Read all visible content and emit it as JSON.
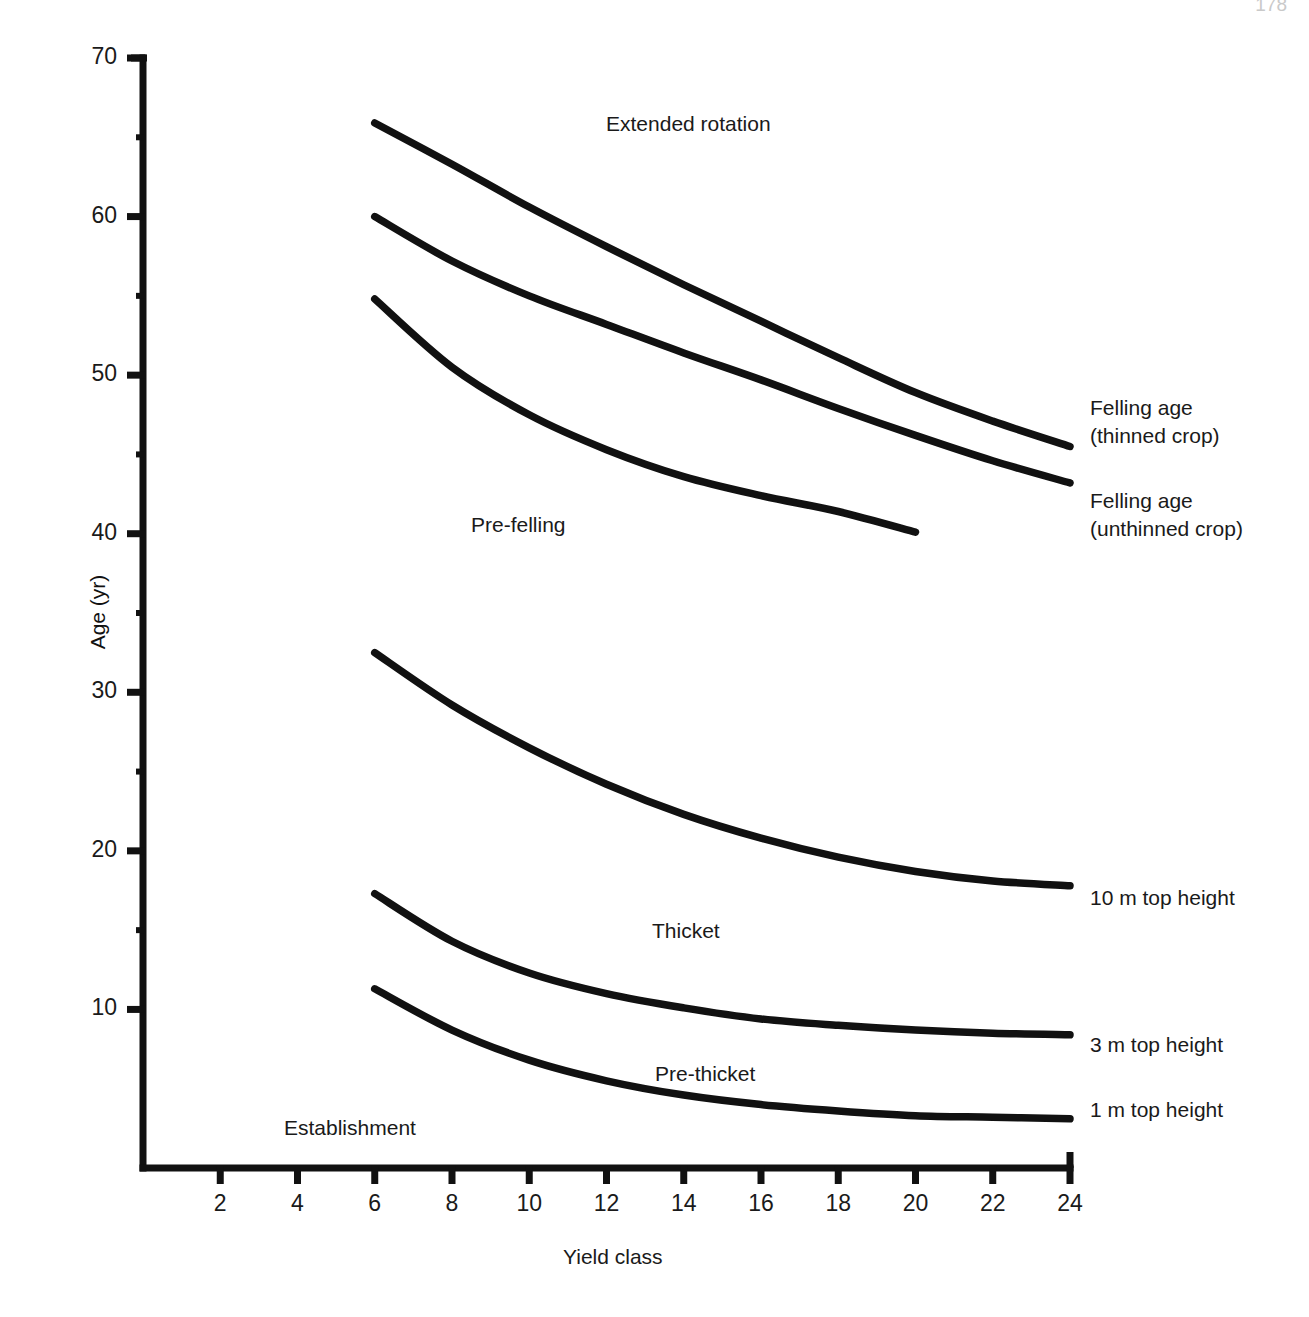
{
  "page": {
    "corner_mark": "178",
    "background": "#ffffff",
    "ink": "#111111"
  },
  "chart_data": {
    "type": "line",
    "title": "",
    "xlabel": "Yield class",
    "ylabel": "Age (yr)",
    "xlim": [
      0,
      25
    ],
    "ylim": [
      0,
      70
    ],
    "xticks": [
      2,
      4,
      6,
      8,
      10,
      12,
      14,
      16,
      18,
      20,
      22,
      24
    ],
    "yticks": [
      10,
      20,
      30,
      40,
      50,
      60,
      70
    ],
    "yminor": [
      15,
      25,
      35,
      45,
      55,
      65
    ],
    "grid": false,
    "legend_position": "right-of-plot (inline end-of-line labels)",
    "series": [
      {
        "name": "Extended rotation boundary",
        "end_label": "",
        "x": [
          6,
          8,
          10,
          12,
          14,
          16,
          18,
          20,
          22,
          24
        ],
        "y": [
          65.9,
          63.3,
          60.6,
          58.1,
          55.7,
          53.4,
          51.1,
          48.9,
          47.1,
          45.5
        ]
      },
      {
        "name": "Felling age (thinned crop)",
        "end_label": "Felling age\n(thinned crop)",
        "x": [
          6,
          8,
          10,
          12,
          14,
          16,
          18,
          20,
          22,
          24
        ],
        "y": [
          60.0,
          57.2,
          55.0,
          53.2,
          51.4,
          49.7,
          47.9,
          46.2,
          44.6,
          43.2
        ]
      },
      {
        "name": "Felling age (unthinned crop)",
        "end_label": "Felling age\n(unthinned crop)",
        "x": [
          6,
          8,
          10,
          12,
          14,
          16,
          18,
          20
        ],
        "y": [
          54.8,
          50.5,
          47.5,
          45.3,
          43.6,
          42.4,
          41.4,
          40.1
        ]
      },
      {
        "name": "10 m top height",
        "end_label": "10 m top height",
        "x": [
          6,
          8,
          10,
          12,
          14,
          16,
          18,
          20,
          22,
          24
        ],
        "y": [
          32.5,
          29.2,
          26.5,
          24.2,
          22.3,
          20.8,
          19.6,
          18.7,
          18.1,
          17.8
        ]
      },
      {
        "name": "3 m top height",
        "end_label": "3 m top height",
        "x": [
          6,
          8,
          10,
          12,
          14,
          16,
          18,
          20,
          22,
          24
        ],
        "y": [
          17.3,
          14.3,
          12.3,
          11.0,
          10.1,
          9.4,
          9.0,
          8.7,
          8.5,
          8.4
        ]
      },
      {
        "name": "1 m top height",
        "end_label": "1 m top height",
        "x": [
          6,
          8,
          10,
          12,
          14,
          16,
          18,
          20,
          22,
          24
        ],
        "y": [
          11.3,
          8.7,
          6.8,
          5.5,
          4.6,
          4.0,
          3.6,
          3.3,
          3.2,
          3.1
        ]
      }
    ],
    "zone_annotations": [
      {
        "text": "Extended rotation",
        "x": 20.5,
        "y": 68.3
      },
      {
        "text": "Pre-felling",
        "x": 12.6,
        "y": 42.7
      },
      {
        "text": "Thicket",
        "x": 18.0,
        "y": 16.2
      },
      {
        "text": "Pre-thicket",
        "x": 19.4,
        "y": 7.2
      },
      {
        "text": "Establishment",
        "x": 6.9,
        "y": 3.7
      }
    ]
  },
  "labels": {
    "extended_rotation": "Extended rotation",
    "pre_felling": "Pre-felling",
    "thicket": "Thicket",
    "pre_thicket": "Pre-thicket",
    "establishment": "Establishment",
    "felling_thinned_l1": "Felling age",
    "felling_thinned_l2": "(thinned crop)",
    "felling_unthinned_l1": "Felling age",
    "felling_unthinned_l2": "(unthinned crop)",
    "top10": "10 m top height",
    "top3": "3 m top height",
    "top1": "1 m top height",
    "xaxis_title": "Yield class",
    "yaxis_title": "Age (yr)"
  },
  "ticks": {
    "x": [
      "2",
      "4",
      "6",
      "8",
      "10",
      "12",
      "14",
      "16",
      "18",
      "20",
      "22",
      "24"
    ],
    "y": [
      "70",
      "60",
      "50",
      "40",
      "30",
      "20",
      "10"
    ]
  }
}
